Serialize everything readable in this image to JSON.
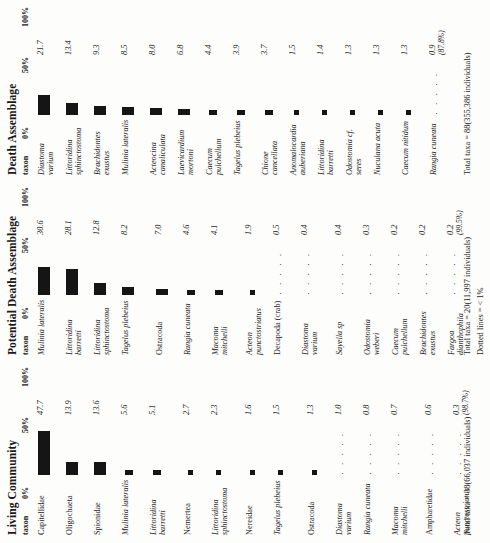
{
  "figure": {
    "axis_ticks": {
      "zero": "0%",
      "fifty": "50%",
      "hundred": "100%"
    },
    "taxon_header": "taxon",
    "dotted_note": "Dotted lines = < 1%"
  },
  "panels": [
    {
      "id": "living",
      "title": "Living Community",
      "total": "Total taxa = 38(66,037 individuals)",
      "rows": [
        {
          "taxon": "Capitellidae",
          "italic": false,
          "value": "47.7",
          "pct": "",
          "bar": 47.7,
          "dotted": false,
          "gap_before": false
        },
        {
          "taxon": "Oligochaeta",
          "italic": false,
          "value": "13.9",
          "pct": "",
          "bar": 13.9,
          "dotted": false,
          "gap_before": false
        },
        {
          "taxon": "Spionidae",
          "italic": false,
          "value": "13.6",
          "pct": "",
          "bar": 13.6,
          "dotted": false,
          "gap_before": false
        },
        {
          "taxon": "Mulinia lateralis",
          "italic": true,
          "value": "5.6",
          "pct": "",
          "bar": 5.6,
          "dotted": false,
          "gap_before": false
        },
        {
          "taxon": "Littoridina barretti",
          "italic": true,
          "value": "5.1",
          "pct": "",
          "bar": 5.1,
          "dotted": false,
          "gap_before": false
        },
        {
          "taxon": "Nemertea",
          "italic": false,
          "value": "2.7",
          "pct": "",
          "bar": 2.7,
          "dotted": false,
          "gap_before": true
        },
        {
          "taxon": "Littoridina sphinctostoma",
          "italic": true,
          "value": "2.3",
          "pct": "",
          "bar": 2.3,
          "dotted": false,
          "gap_before": false
        },
        {
          "taxon": "Nereidae",
          "italic": false,
          "value": "1.6",
          "pct": "",
          "bar": 1.6,
          "dotted": false,
          "gap_before": true
        },
        {
          "taxon": "Tagelus plebeius",
          "italic": true,
          "value": "1.5",
          "pct": "",
          "bar": 1.5,
          "dotted": false,
          "gap_before": false
        },
        {
          "taxon": "Ostracoda",
          "italic": false,
          "value": "1.3",
          "pct": "",
          "bar": 1.3,
          "dotted": false,
          "gap_before": true
        },
        {
          "taxon": "Diastoma varium",
          "italic": true,
          "value": "1.0",
          "pct": "",
          "bar": 0,
          "dotted": true,
          "gap_before": false
        },
        {
          "taxon": "Rangia cuneata",
          "italic": true,
          "value": "0.8",
          "pct": "",
          "bar": 0,
          "dotted": true,
          "gap_before": false
        },
        {
          "taxon": "Macoma mitchelli",
          "italic": true,
          "value": "0.7",
          "pct": "",
          "bar": 0,
          "dotted": true,
          "gap_before": false
        },
        {
          "taxon": "Ampharetidae",
          "italic": false,
          "value": "0.6",
          "pct": "",
          "bar": 0,
          "dotted": true,
          "gap_before": true
        },
        {
          "taxon": "Acteon punctostriatus",
          "italic": true,
          "value": "0.3",
          "pct": "(98.7%)",
          "bar": 0,
          "dotted": true,
          "gap_before": false
        }
      ]
    },
    {
      "id": "potential",
      "title": "Potential Death Assemblage",
      "total": "Total taxa = 20(11,997 individuals)",
      "rows": [
        {
          "taxon": "Mulinia lateralis",
          "italic": true,
          "value": "30.6",
          "pct": "",
          "bar": 30.6,
          "dotted": false,
          "gap_before": false
        },
        {
          "taxon": "Littoridina barretti",
          "italic": true,
          "value": "28.1",
          "pct": "",
          "bar": 28.1,
          "dotted": false,
          "gap_before": false
        },
        {
          "taxon": "Littoridina sphinctostoma",
          "italic": true,
          "value": "12.8",
          "pct": "",
          "bar": 12.8,
          "dotted": false,
          "gap_before": false
        },
        {
          "taxon": "Tagelus plebeius",
          "italic": true,
          "value": "8.2",
          "pct": "",
          "bar": 8.2,
          "dotted": false,
          "gap_before": false
        },
        {
          "taxon": "Ostracoda",
          "italic": false,
          "value": "7.0",
          "pct": "",
          "bar": 7.0,
          "dotted": false,
          "gap_before": true
        },
        {
          "taxon": "Rangia cuneata",
          "italic": true,
          "value": "4.6",
          "pct": "",
          "bar": 4.6,
          "dotted": false,
          "gap_before": false
        },
        {
          "taxon": "Macoma mitchelli",
          "italic": true,
          "value": "4.1",
          "pct": "",
          "bar": 4.1,
          "dotted": false,
          "gap_before": false
        },
        {
          "taxon": "Acteon punctostriatus",
          "italic": true,
          "value": "1.9",
          "pct": "",
          "bar": 1.9,
          "dotted": false,
          "gap_before": true
        },
        {
          "taxon": "Decapoda (crab)",
          "italic": false,
          "value": "0.5",
          "pct": "",
          "bar": 0,
          "dotted": true,
          "gap_before": false
        },
        {
          "taxon": "Diastoma varium",
          "italic": true,
          "value": "0.4",
          "pct": "",
          "bar": 0,
          "dotted": true,
          "gap_before": false
        },
        {
          "taxon": "Sayella sp",
          "italic": true,
          "value": "0.4",
          "pct": "",
          "bar": 0,
          "dotted": true,
          "gap_before": true
        },
        {
          "taxon": "Odostomia weberi",
          "italic": true,
          "value": "0.3",
          "pct": "",
          "bar": 0,
          "dotted": true,
          "gap_before": false
        },
        {
          "taxon": "Caecum pulchellum",
          "italic": true,
          "value": "0.2",
          "pct": "",
          "bar": 0,
          "dotted": true,
          "gap_before": false
        },
        {
          "taxon": "Brachidontes exustus",
          "italic": true,
          "value": "0.2",
          "pct": "",
          "bar": 0,
          "dotted": true,
          "gap_before": false
        },
        {
          "taxon": "Fargoa dianthophila",
          "italic": true,
          "value": "0.2",
          "pct": "(99.5%)",
          "bar": 0,
          "dotted": true,
          "gap_before": false
        }
      ]
    },
    {
      "id": "death",
      "title": "Death Assemblage",
      "total": "Total taxa = 88(355,386 individuals)",
      "rows": [
        {
          "taxon": "Diastoma varium",
          "italic": true,
          "value": "21.7",
          "pct": "",
          "bar": 21.7,
          "dotted": false,
          "gap_before": false
        },
        {
          "taxon": "Littoridina sphinctostoma",
          "italic": true,
          "value": "13.4",
          "pct": "",
          "bar": 13.4,
          "dotted": false,
          "gap_before": false
        },
        {
          "taxon": "Brachidontes exustus",
          "italic": true,
          "value": "9.3",
          "pct": "",
          "bar": 9.3,
          "dotted": false,
          "gap_before": false
        },
        {
          "taxon": "Mulinia lateralis",
          "italic": true,
          "value": "8.5",
          "pct": "",
          "bar": 8.5,
          "dotted": false,
          "gap_before": false
        },
        {
          "taxon": "Acteocina canaliculata",
          "italic": true,
          "value": "8.0",
          "pct": "",
          "bar": 8.0,
          "dotted": false,
          "gap_before": false
        },
        {
          "taxon": "Laevicardium mortoni",
          "italic": true,
          "value": "6.8",
          "pct": "",
          "bar": 6.8,
          "dotted": false,
          "gap_before": false
        },
        {
          "taxon": "Caecum pulchellum",
          "italic": true,
          "value": "4.4",
          "pct": "",
          "bar": 4.4,
          "dotted": false,
          "gap_before": false
        },
        {
          "taxon": "Tagelus plebeius",
          "italic": true,
          "value": "3.9",
          "pct": "",
          "bar": 3.9,
          "dotted": false,
          "gap_before": false
        },
        {
          "taxon": "Chione cancellata",
          "italic": true,
          "value": "3.7",
          "pct": "",
          "bar": 3.7,
          "dotted": false,
          "gap_before": false
        },
        {
          "taxon": "Anomalocardia auberiana",
          "italic": true,
          "value": "1.5",
          "pct": "",
          "bar": 1.5,
          "dotted": false,
          "gap_before": false
        },
        {
          "taxon": "Littoridina barretti",
          "italic": true,
          "value": "1.4",
          "pct": "",
          "bar": 1.4,
          "dotted": false,
          "gap_before": false
        },
        {
          "taxon": "Odostomia cf. seres",
          "italic": true,
          "value": "1.3",
          "pct": "",
          "bar": 1.3,
          "dotted": false,
          "gap_before": false
        },
        {
          "taxon": "Nuculana acuta",
          "italic": true,
          "value": "1.3",
          "pct": "",
          "bar": 1.3,
          "dotted": false,
          "gap_before": false
        },
        {
          "taxon": "Caecum nitidum",
          "italic": true,
          "value": "1.3",
          "pct": "",
          "bar": 1.3,
          "dotted": false,
          "gap_before": false
        },
        {
          "taxon": "Rangia cuneata",
          "italic": true,
          "value": "0.9",
          "pct": "(87.8%)",
          "bar": 0,
          "dotted": true,
          "gap_before": false
        }
      ]
    }
  ]
}
